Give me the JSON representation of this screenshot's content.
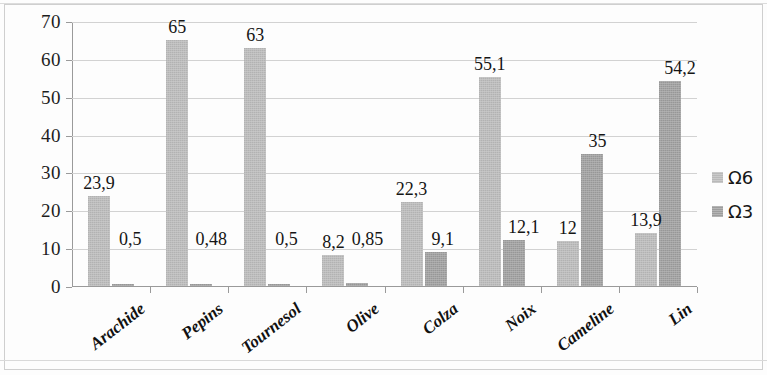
{
  "chart_data": {
    "type": "bar",
    "title": "",
    "subtitle": "",
    "xlabel": "",
    "ylabel": "",
    "ylim": [
      0,
      70
    ],
    "ytick_step": 10,
    "yticks": [
      "0",
      "10",
      "20",
      "30",
      "40",
      "50",
      "60",
      "70"
    ],
    "grid": true,
    "legend_position": "right",
    "categories": [
      "Arachide",
      "Pepins",
      "Tournesol",
      "Olive",
      "Colza",
      "Noix",
      "Cameline",
      "Lin"
    ],
    "series": [
      {
        "name": "Ω6",
        "color": "#b9b9b9",
        "values": [
          23.9,
          65,
          63,
          8.2,
          22.3,
          55.1,
          12,
          13.9
        ],
        "labels": [
          "23,9",
          "65",
          "63",
          "8,2",
          "22,3",
          "55,1",
          "12",
          "13,9"
        ]
      },
      {
        "name": "Ω3",
        "color": "#9d9d9d",
        "values": [
          0.5,
          0.48,
          0.5,
          0.85,
          9.1,
          12.1,
          35,
          54.2
        ],
        "labels": [
          "0,5",
          "0,48",
          "0,5",
          "0,85",
          "9,1",
          "12,1",
          "35",
          "54,2"
        ]
      }
    ]
  },
  "legend": {
    "items": [
      {
        "label": "Ω6",
        "color": "#b9b9b9"
      },
      {
        "label": "Ω3",
        "color": "#9d9d9d"
      }
    ]
  }
}
